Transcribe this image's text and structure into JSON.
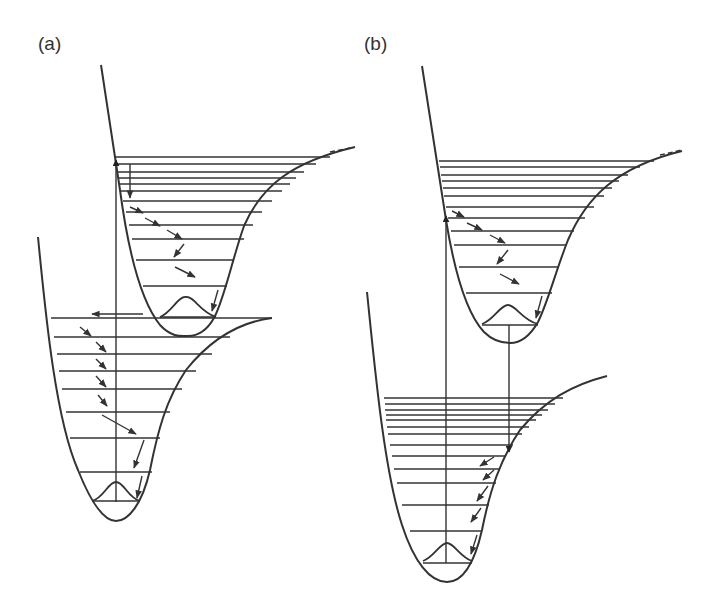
{
  "figure": {
    "panels": [
      {
        "label": "(a)",
        "description": "Excited-state absorption, vibrational relaxation in upper state, crossing to lower state, and vibrational relaxation to ground level (internal conversion)",
        "upper_potential": {
          "levels_count": 13
        },
        "lower_potential": {
          "levels_count": 9
        },
        "transitions": [
          "vertical absorption arrow up",
          "horizontal crossing arrow left",
          "cascade of small relaxation arrows"
        ]
      },
      {
        "label": "(b)",
        "description": "Absorption to upper state, vibrational relaxation, vertical emission down to lower state, then vibrational relaxation to ground level (fluorescence)",
        "upper_potential": {
          "levels_count": 13
        },
        "lower_potential": {
          "levels_count": 14
        },
        "transitions": [
          "vertical absorption arrow up",
          "vertical emission arrow down",
          "cascade of small relaxation arrows"
        ]
      }
    ],
    "colors": {
      "line": "#333333",
      "background": "#ffffff"
    }
  }
}
